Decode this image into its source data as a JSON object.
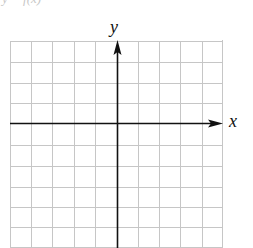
{
  "figure": {
    "cut_off_caption": "y = f(x)",
    "x_axis_label": "x",
    "y_axis_label": "y",
    "grid": {
      "columns": 10,
      "rows": 10,
      "columns_left_of_y_axis": 5,
      "columns_right_of_y_axis": 5,
      "rows_above_x_axis": 4,
      "rows_below_x_axis": 6,
      "line_color": "#c6c6c6",
      "axis_color": "#111111"
    }
  }
}
